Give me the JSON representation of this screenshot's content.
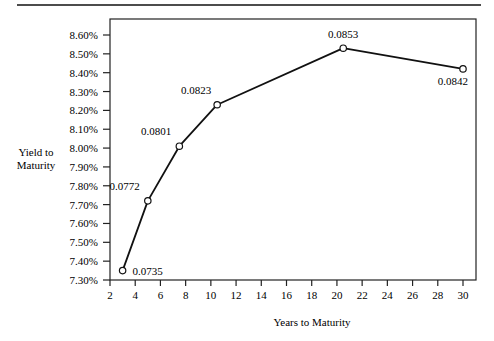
{
  "chart_data": {
    "type": "line",
    "title": "",
    "xlabel": "Years to Maturity",
    "ylabel": [
      "Yield to",
      "Maturity"
    ],
    "x": [
      3,
      5,
      7.5,
      10.5,
      20.5,
      30
    ],
    "series": [
      {
        "name": "Yield to Maturity",
        "values": [
          0.0735,
          0.0772,
          0.0801,
          0.0823,
          0.0853,
          0.0842
        ],
        "labels": [
          "0.0735",
          "0.0772",
          "0.0801",
          "0.0823",
          "0.0853",
          "0.0842"
        ],
        "marker": "open-circle"
      }
    ],
    "xticks": [
      2,
      4,
      6,
      8,
      10,
      12,
      14,
      16,
      18,
      20,
      22,
      24,
      26,
      28,
      30
    ],
    "yticks": [
      "7.30%",
      "7.40%",
      "7.50%",
      "7.60%",
      "7.70%",
      "7.80%",
      "7.90%",
      "8.00%",
      "8.10%",
      "8.20%",
      "8.30%",
      "8.40%",
      "8.50%",
      "8.60%"
    ],
    "xlim": [
      2,
      31
    ],
    "ylim": [
      0.073,
      0.0868
    ],
    "grid": false,
    "legend": null,
    "colors": {
      "line": "#111111",
      "marker_fill": "#ffffff",
      "frame": "#222222"
    }
  }
}
